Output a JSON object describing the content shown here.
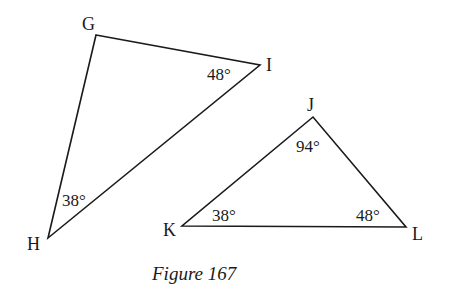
{
  "figure": {
    "caption": "Figure 167",
    "triangles": [
      {
        "name": "GHI",
        "vertices": {
          "G": {
            "label": "G",
            "x": 96,
            "y": 35
          },
          "H": {
            "label": "H",
            "x": 48,
            "y": 238
          },
          "I": {
            "label": "I",
            "x": 260,
            "y": 65
          }
        },
        "angles": {
          "I": "48°",
          "H": "38°"
        }
      },
      {
        "name": "JKL",
        "vertices": {
          "J": {
            "label": "J",
            "x": 313,
            "y": 117
          },
          "K": {
            "label": "K",
            "x": 182,
            "y": 226
          },
          "L": {
            "label": "L",
            "x": 406,
            "y": 227
          }
        },
        "angles": {
          "J": "94°",
          "K": "38°",
          "L": "48°"
        }
      }
    ]
  }
}
